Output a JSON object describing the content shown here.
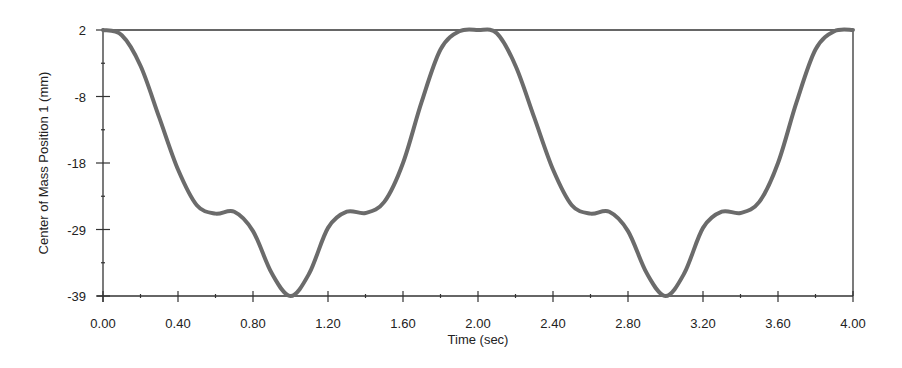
{
  "chart_data": {
    "type": "line",
    "title": "",
    "xlabel": "Time (sec)",
    "ylabel": "Center of Mass Position 1 (mm)",
    "xlim": [
      0,
      4
    ],
    "ylim": [
      -39,
      2
    ],
    "grid": false,
    "legend": null,
    "x_ticks": [
      "0.00",
      "0.40",
      "0.80",
      "1.20",
      "1.60",
      "2.00",
      "2.40",
      "2.80",
      "3.20",
      "3.60",
      "4.00"
    ],
    "y_ticks": [
      "2",
      "-8",
      "-18",
      "-29",
      "-39"
    ],
    "series": [
      {
        "name": "Center of Mass Position 1",
        "color": "#6b6b6b",
        "x": [
          0.0,
          0.1,
          0.2,
          0.3,
          0.4,
          0.5,
          0.6,
          0.7,
          0.8,
          0.9,
          1.0,
          1.1,
          1.2,
          1.3,
          1.4,
          1.5,
          1.6,
          1.7,
          1.8,
          1.9,
          2.0,
          2.1,
          2.2,
          2.3,
          2.4,
          2.5,
          2.6,
          2.7,
          2.8,
          2.9,
          3.0,
          3.1,
          3.2,
          3.3,
          3.4,
          3.5,
          3.6,
          3.7,
          3.8,
          3.9,
          4.0
        ],
        "y": [
          2.0,
          1.2,
          -3.5,
          -11.5,
          -19.5,
          -25.0,
          -26.3,
          -26.0,
          -29.0,
          -35.5,
          -39.0,
          -35.5,
          -28.5,
          -26.0,
          -26.2,
          -24.5,
          -18.5,
          -9.0,
          -1.0,
          1.8,
          2.0,
          1.5,
          -3.5,
          -11.5,
          -19.5,
          -25.0,
          -26.3,
          -26.0,
          -29.0,
          -35.5,
          -39.0,
          -35.5,
          -28.5,
          -26.0,
          -26.2,
          -24.5,
          -18.5,
          -9.0,
          -1.0,
          1.8,
          2.2
        ]
      }
    ]
  }
}
